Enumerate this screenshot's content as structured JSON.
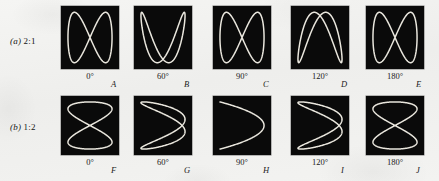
{
  "figure": {
    "background_color": "#f1f1ef",
    "panel_color": "#0a0a0a",
    "trace_color": "#e9e6dd",
    "rows": [
      {
        "id": "row-a",
        "paren": "(a)",
        "ratio": "2:1",
        "label_x": 10,
        "label_y": 36,
        "panel_y": 6,
        "panel_height": 63,
        "deg_y": 71,
        "letter_y": 79,
        "panels": [
          {
            "letter": "A",
            "degrees": "0°",
            "phase": 0,
            "x": 61,
            "width": 58,
            "deg_center_x": 90,
            "letter_x": 111
          },
          {
            "letter": "B",
            "degrees": "60°",
            "phase": 60,
            "x": 134,
            "width": 58,
            "deg_center_x": 163,
            "letter_x": 184
          },
          {
            "letter": "C",
            "degrees": "90°",
            "phase": 90,
            "x": 213,
            "width": 58,
            "deg_center_x": 242,
            "letter_x": 263
          },
          {
            "letter": "D",
            "degrees": "120°",
            "phase": 120,
            "x": 291,
            "width": 58,
            "deg_center_x": 320,
            "letter_x": 341
          },
          {
            "letter": "E",
            "degrees": "180°",
            "phase": 180,
            "x": 366,
            "width": 58,
            "deg_center_x": 395,
            "letter_x": 416
          }
        ]
      },
      {
        "id": "row-b",
        "paren": "(b)",
        "ratio": "1:2",
        "label_x": 10,
        "label_y": 122,
        "panel_y": 96,
        "panel_height": 59,
        "deg_y": 157,
        "letter_y": 165,
        "panels": [
          {
            "letter": "F",
            "degrees": "0°",
            "phase": 0,
            "x": 61,
            "width": 58,
            "deg_center_x": 90,
            "letter_x": 111
          },
          {
            "letter": "G",
            "degrees": "60°",
            "phase": 60,
            "x": 134,
            "width": 58,
            "deg_center_x": 163,
            "letter_x": 184
          },
          {
            "letter": "H",
            "degrees": "90°",
            "phase": 90,
            "x": 213,
            "width": 58,
            "deg_center_x": 242,
            "letter_x": 263
          },
          {
            "letter": "I",
            "degrees": "120°",
            "phase": 120,
            "x": 291,
            "width": 58,
            "deg_center_x": 320,
            "letter_x": 341
          },
          {
            "letter": "J",
            "degrees": "180°",
            "phase": 180,
            "x": 366,
            "width": 58,
            "deg_center_x": 395,
            "letter_x": 416
          }
        ]
      }
    ]
  },
  "chart_data": {
    "type": "line",
    "xlabel": "",
    "ylabel": "",
    "grid": false,
    "legend": "none",
    "xlim": [
      -1,
      1
    ],
    "ylim": [
      -1,
      1
    ],
    "parametric": {
      "x_equation": "x = sin(fx * t + phase)",
      "y_equation": "y = sin(fy * t)",
      "t_range_deg": [
        0,
        360
      ],
      "samples": 400
    },
    "series": [
      {
        "name": "A",
        "row": "(a) 2:1",
        "phase_deg": 0,
        "fx": 1,
        "fy": 2,
        "shape": "figure-eight, vertical, two lobes side by side"
      },
      {
        "name": "B",
        "row": "(a) 2:1",
        "phase_deg": 60,
        "fx": 1,
        "fy": 2,
        "shape": "two overlapping arches opening downward"
      },
      {
        "name": "C",
        "row": "(a) 2:1",
        "phase_deg": 90,
        "fx": 1,
        "fy": 2,
        "shape": "single parabolic arch opening downward"
      },
      {
        "name": "D",
        "row": "(a) 2:1",
        "phase_deg": 120,
        "fx": 1,
        "fy": 2,
        "shape": "two overlapping arches opening downward, mirrored"
      },
      {
        "name": "E",
        "row": "(a) 2:1",
        "phase_deg": 180,
        "fx": 1,
        "fy": 2,
        "shape": "figure-eight, vertical, two lobes side by side"
      },
      {
        "name": "F",
        "row": "(b) 1:2",
        "phase_deg": 0,
        "fx": 2,
        "fy": 1,
        "shape": "figure-eight, horizontal, two lobes stacked"
      },
      {
        "name": "G",
        "row": "(b) 1:2",
        "phase_deg": 60,
        "fx": 2,
        "fy": 1,
        "shape": "two overlapping arches opening left"
      },
      {
        "name": "H",
        "row": "(b) 1:2",
        "phase_deg": 90,
        "fx": 2,
        "fy": 1,
        "shape": "single parabolic arch opening left"
      },
      {
        "name": "I",
        "row": "(b) 1:2",
        "phase_deg": 120,
        "fx": 2,
        "fy": 1,
        "shape": "two overlapping arches opening left, mirrored"
      },
      {
        "name": "J",
        "row": "(b) 1:2",
        "phase_deg": 180,
        "fx": 2,
        "fy": 1,
        "shape": "figure-eight, horizontal, two lobes stacked"
      }
    ]
  }
}
